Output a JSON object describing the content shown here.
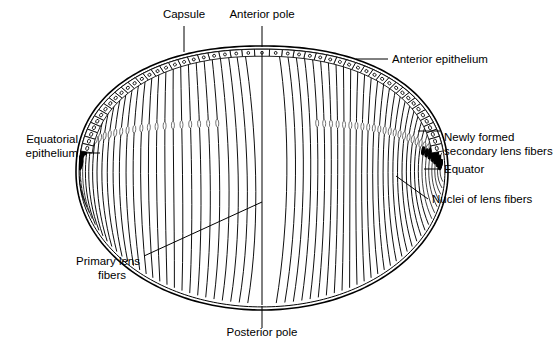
{
  "figure": {
    "background_color": "#ffffff",
    "line_color": "#000000",
    "width": 555,
    "height": 345
  },
  "labels": [
    {
      "id": "capsule",
      "text": "Capsule",
      "lines": [
        "Capsule"
      ],
      "x": 184,
      "y": 18,
      "anchor": "middle"
    },
    {
      "id": "anterior-pole",
      "text": "Anterior pole",
      "lines": [
        "Anterior pole"
      ],
      "x": 262,
      "y": 18,
      "anchor": "middle"
    },
    {
      "id": "anterior-epithelium",
      "text": "Anterior epithelium",
      "lines": [
        "Anterior epithelium"
      ],
      "x": 392,
      "y": 63,
      "anchor": "start"
    },
    {
      "id": "equatorial-epithelium",
      "text": "Equatorial epithelium",
      "lines": [
        "Equatorial",
        "epithelium"
      ],
      "x": 78,
      "y": 143,
      "anchor": "end"
    },
    {
      "id": "newly-formed-secondary-lens-fibers",
      "text": "Newly formed secondary lens fibers",
      "lines": [
        "Newly formed",
        "secondary lens fibers"
      ],
      "x": 444,
      "y": 141,
      "anchor": "start"
    },
    {
      "id": "equator",
      "text": "Equator",
      "lines": [
        "Equator"
      ],
      "x": 444,
      "y": 173,
      "anchor": "start"
    },
    {
      "id": "nuclei-of-lens-fibers",
      "text": "Nuclei of lens fibers",
      "lines": [
        "Nuclei of lens fibers"
      ],
      "x": 432,
      "y": 203,
      "anchor": "start"
    },
    {
      "id": "primary-lens-fibers",
      "text": "Primary lens fibers",
      "lines": [
        "Primary lens",
        "fibers"
      ],
      "x": 140,
      "y": 265,
      "anchor": "end"
    },
    {
      "id": "posterior-pole",
      "text": "Posterior pole",
      "lines": [
        "Posterior pole"
      ],
      "x": 262,
      "y": 336,
      "anchor": "middle"
    }
  ],
  "leader_lines": [
    {
      "id": "leader-capsule",
      "points": "184,26 184,52"
    },
    {
      "id": "leader-anterior-pole",
      "points": "262,26 262,47"
    },
    {
      "id": "leader-anterior-epithelium",
      "points": "388,59 356,59"
    },
    {
      "id": "leader-equatorial-epithelium",
      "points": "82,153 100,153"
    },
    {
      "id": "leader-newly-formed",
      "points": "440,131 418,131"
    },
    {
      "id": "leader-equator",
      "points": "440,169 424,169"
    },
    {
      "id": "leader-nuclei",
      "points": "428,199 396,176"
    },
    {
      "id": "leader-primary-lens-fibers",
      "points": "144,256 262,202"
    },
    {
      "id": "leader-posterior-pole",
      "points": "262,328 262,306"
    }
  ],
  "structures": [
    {
      "id": "lens-capsule-outer",
      "name": "Lens capsule (outer outline)"
    },
    {
      "id": "lens-capsule-inner",
      "name": "Lens capsule (inner outline)"
    },
    {
      "id": "anterior-epithelial-cells",
      "name": "Cuboidal anterior epithelial cell row with nuclei",
      "cell_count": 49
    },
    {
      "id": "lens-fiber-lines",
      "name": "Meridional lens fibers",
      "fiber_count": 62
    },
    {
      "id": "lens-fiber-nuclei",
      "name": "Oval nuclei of lens fibers forming the nuclear bow"
    },
    {
      "id": "equator-nuclear-bow",
      "name": "Dense nuclear bow at the equator"
    },
    {
      "id": "anterior-pole-axis",
      "name": "Optical axis line from anterior to posterior pole"
    }
  ],
  "colors": {
    "ink": "#000000",
    "paper": "#ffffff",
    "faint_nucleus": "#555555"
  }
}
